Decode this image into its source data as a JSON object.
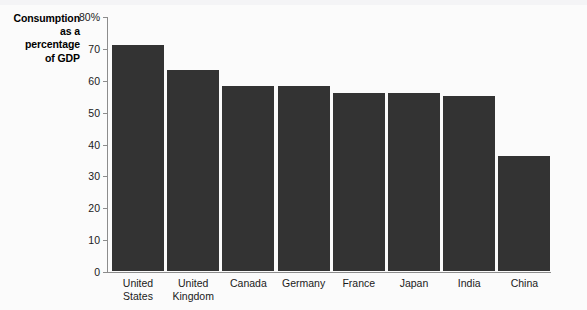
{
  "axis_title": {
    "lines": [
      "Consumption",
      "as a",
      "percentage",
      "of GDP"
    ]
  },
  "chart_data": {
    "type": "bar",
    "title": "",
    "subtitle": "",
    "xlabel": "",
    "ylabel": "Consumption as a percentage of GDP",
    "ylim": [
      0,
      80
    ],
    "grid": false,
    "legend": null,
    "bar_color": "#333333",
    "axis_color": "#8c8c8c",
    "y_ticks": [
      0,
      10,
      20,
      30,
      40,
      50,
      60,
      70,
      80
    ],
    "y_tick_labels": [
      "0",
      "10",
      "20",
      "30",
      "40",
      "50",
      "60",
      "70",
      "80%"
    ],
    "categories": [
      "United States",
      "United Kingdom",
      "Canada",
      "Germany",
      "France",
      "Japan",
      "India",
      "China"
    ],
    "category_label_lines": [
      [
        "United",
        "States"
      ],
      [
        "United",
        "Kingdom"
      ],
      [
        "Canada"
      ],
      [
        "Germany"
      ],
      [
        "France"
      ],
      [
        "Japan"
      ],
      [
        "India"
      ],
      [
        "China"
      ]
    ],
    "values": [
      71,
      63,
      58,
      58,
      56,
      56,
      55,
      36
    ]
  }
}
